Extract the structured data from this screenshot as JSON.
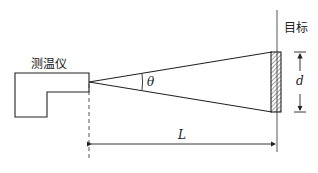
{
  "diagram": {
    "type": "physics-schematic",
    "labels": {
      "instrument": "测温仪",
      "target": "目标",
      "angle": "θ",
      "target_size": "d",
      "distance": "L"
    },
    "colors": {
      "line": "#222222",
      "hatch": "#444444",
      "background": "#ffffff"
    }
  }
}
